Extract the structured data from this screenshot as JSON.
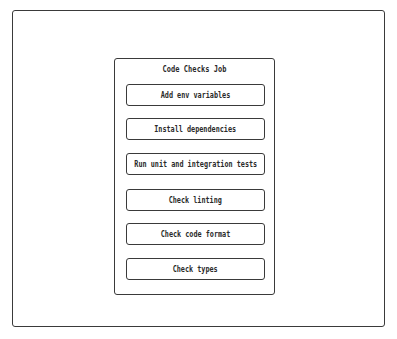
{
  "diagram": {
    "type": "pipeline-job",
    "job": {
      "title": "Code Checks Job",
      "steps": [
        {
          "label": "Add env variables"
        },
        {
          "label": "Install dependencies"
        },
        {
          "label": "Run unit and integration tests"
        },
        {
          "label": "Check linting"
        },
        {
          "label": "Check code format"
        },
        {
          "label": "Check types"
        }
      ]
    }
  },
  "colors": {
    "stroke": "#3a3a3a",
    "text": "#2a2a2a",
    "background": "#ffffff"
  }
}
